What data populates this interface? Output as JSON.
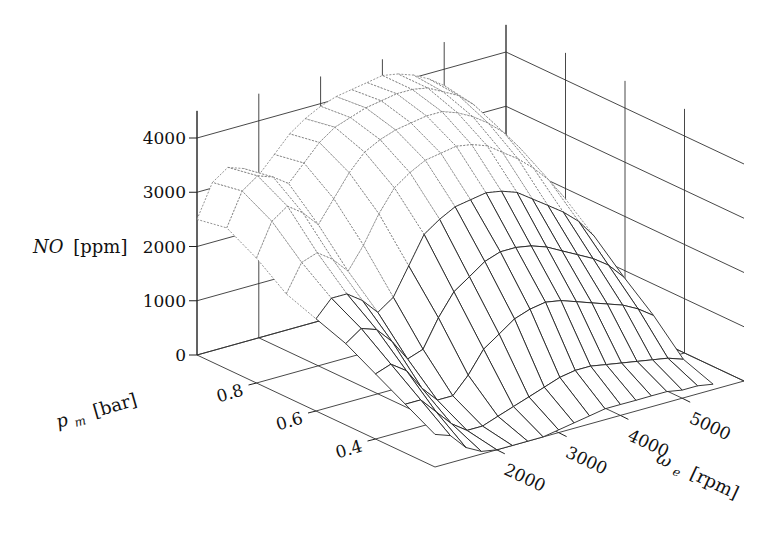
{
  "chart_data": {
    "type": "surface3d",
    "title": "",
    "zlabel": "NO [ppm]",
    "xlabel": "ω_e [rpm]",
    "ylabel": "p_m [bar]",
    "zlabel_parts": {
      "main": "NO",
      "unit": "[ppm]"
    },
    "xlabel_parts": {
      "main": "ω",
      "sub": "e",
      "unit": "[rpm]"
    },
    "ylabel_parts": {
      "main": "p",
      "sub": "m",
      "unit": "[bar]"
    },
    "z_ticks": [
      0,
      1000,
      2000,
      3000,
      4000
    ],
    "z_tick_labels": [
      "0",
      "1000",
      "2000",
      "3000",
      "4000"
    ],
    "x_ticks": [
      2000,
      3000,
      4000,
      5000
    ],
    "x_tick_labels": [
      "2000",
      "3000",
      "4000",
      "5000"
    ],
    "y_ticks": [
      0.8,
      0.6,
      0.4
    ],
    "y_tick_labels": [
      "0.8",
      "0.6",
      "0.4"
    ],
    "xlim": [
      1000,
      6000
    ],
    "ylim": [
      0.2,
      1.0
    ],
    "zlim": [
      0,
      4500
    ],
    "grid": true,
    "x": [
      1000,
      1250,
      1500,
      1750,
      2000,
      2250,
      2500,
      2750,
      3000,
      3250,
      3500,
      3750,
      4000,
      4250,
      4500,
      4750,
      5000,
      5250,
      5500
    ],
    "y": [
      1.0,
      0.9,
      0.8,
      0.7,
      0.6,
      0.5,
      0.4,
      0.3,
      0.2
    ],
    "z_description": "NO emissions [ppm] as function of engine speed (x) and manifold pressure (y); rows correspond to y values, columns to x values",
    "z": [
      [
        2500,
        3100,
        3300,
        3200,
        3000,
        3300,
        3600,
        3800,
        3950,
        4050,
        4100,
        4150,
        4200,
        4150,
        4050,
        3900,
        3700,
        3300,
        2800
      ],
      [
        2600,
        3200,
        3400,
        3300,
        3100,
        3400,
        3700,
        3900,
        4000,
        4100,
        4150,
        4200,
        4200,
        4150,
        4000,
        3850,
        3600,
        3200,
        2700
      ],
      [
        2300,
        2900,
        3100,
        2900,
        2600,
        3000,
        3400,
        3700,
        3850,
        3950,
        4000,
        4050,
        4050,
        3950,
        3800,
        3600,
        3350,
        3000,
        2500
      ],
      [
        1900,
        2400,
        2500,
        2300,
        2000,
        2400,
        2900,
        3300,
        3500,
        3650,
        3700,
        3750,
        3700,
        3600,
        3400,
        3200,
        2950,
        2650,
        2250
      ],
      [
        1700,
        2000,
        2000,
        1800,
        1500,
        1700,
        2200,
        2700,
        2900,
        3050,
        3100,
        3150,
        3100,
        3000,
        2800,
        2600,
        2400,
        2150,
        1800
      ],
      [
        1500,
        1700,
        1600,
        1300,
        900,
        1000,
        1500,
        1900,
        2100,
        2300,
        2400,
        2400,
        2350,
        2250,
        2100,
        1950,
        1800,
        1600,
        1300
      ],
      [
        1200,
        1300,
        1100,
        700,
        400,
        400,
        700,
        1100,
        1300,
        1500,
        1600,
        1650,
        1600,
        1500,
        1400,
        1300,
        1200,
        1050,
        850
      ],
      [
        900,
        900,
        600,
        300,
        100,
        100,
        200,
        300,
        400,
        500,
        600,
        650,
        650,
        600,
        550,
        500,
        450,
        400,
        300
      ],
      [
        600,
        500,
        200,
        50,
        0,
        0,
        0,
        0,
        50,
        100,
        150,
        200,
        200,
        200,
        200,
        200,
        150,
        150,
        100
      ]
    ]
  }
}
